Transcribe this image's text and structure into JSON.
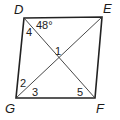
{
  "figure": {
    "type": "quadrilateral-with-diagonals",
    "vertices": [
      {
        "name": "D",
        "x": 24,
        "y": 18,
        "label_x": 14,
        "label_y": 14
      },
      {
        "name": "E",
        "x": 102,
        "y": 17,
        "label_x": 103,
        "label_y": 13
      },
      {
        "name": "F",
        "x": 95,
        "y": 98,
        "label_x": 96,
        "label_y": 113
      },
      {
        "name": "G",
        "x": 16,
        "y": 98,
        "label_x": 5,
        "label_y": 113
      }
    ],
    "diagonals": [
      [
        "D",
        "F"
      ],
      [
        "G",
        "E"
      ]
    ],
    "angle_labels": [
      {
        "text": "48°",
        "x": 36,
        "y": 29
      },
      {
        "text": "4",
        "x": 26,
        "y": 36
      },
      {
        "text": "1",
        "x": 55,
        "y": 55
      },
      {
        "text": "2",
        "x": 20,
        "y": 87
      },
      {
        "text": "3",
        "x": 32,
        "y": 96
      },
      {
        "text": "5",
        "x": 77,
        "y": 96
      }
    ]
  }
}
